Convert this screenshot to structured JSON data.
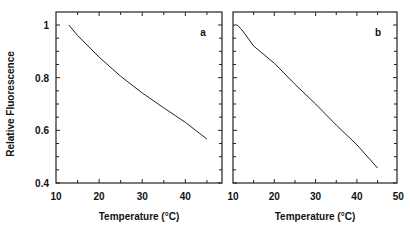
{
  "chart_data": [
    {
      "type": "line",
      "panel_label": "a",
      "title": "",
      "xlabel": "Temperature (°C)",
      "ylabel": "Relative Fluorescence",
      "xlim": [
        10,
        48.5
      ],
      "ylim": [
        0.4,
        1.05
      ],
      "x_ticks": [
        10,
        20,
        30,
        40
      ],
      "y_ticks": [
        0.4,
        0.6,
        0.8,
        1
      ],
      "y_tick_labels": [
        "0.4",
        "0.6",
        "0.8",
        "1"
      ],
      "x_tick_labels": [
        "10",
        "20",
        "30",
        "40"
      ],
      "grid": false,
      "series": [
        {
          "name": "a",
          "x": [
            13,
            15,
            20,
            25,
            30,
            35,
            40,
            45
          ],
          "y": [
            1.0,
            0.96,
            0.878,
            0.805,
            0.742,
            0.685,
            0.63,
            0.567
          ]
        }
      ]
    },
    {
      "type": "line",
      "panel_label": "b",
      "title": "",
      "xlabel": "Temperature (°C)",
      "ylabel": "",
      "xlim": [
        10,
        50
      ],
      "ylim": [
        0.4,
        1.05
      ],
      "x_ticks": [
        10,
        20,
        30,
        40,
        50
      ],
      "x_tick_labels": [
        "10",
        "20",
        "30",
        "40",
        "50"
      ],
      "y_ticks": [
        0.4,
        0.6,
        0.8,
        1
      ],
      "grid": false,
      "series": [
        {
          "name": "b",
          "x": [
            11,
            12,
            15,
            20,
            25,
            30,
            35,
            40,
            45
          ],
          "y": [
            1.0,
            0.985,
            0.92,
            0.855,
            0.775,
            0.7,
            0.62,
            0.545,
            0.457
          ]
        }
      ]
    }
  ]
}
